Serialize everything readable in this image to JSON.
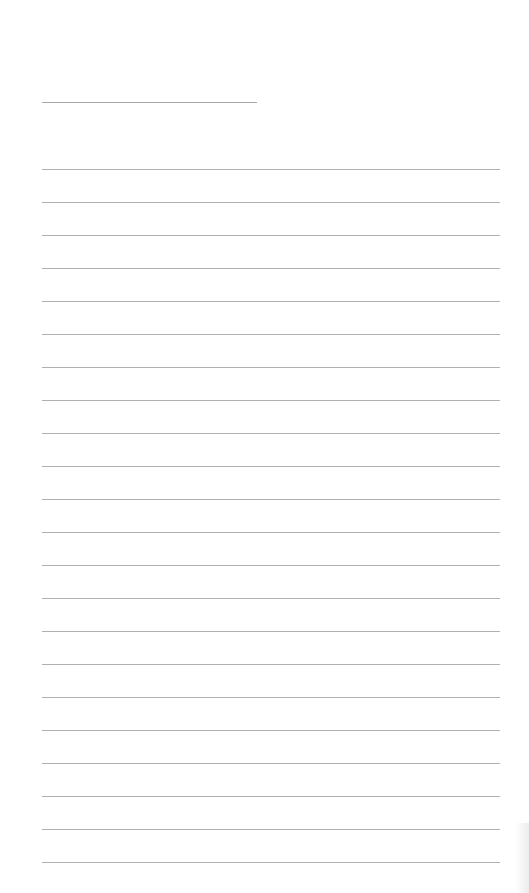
{
  "page": {
    "type": "lined-paper",
    "background_color": "#ffffff",
    "line_color": "#b0b0b0",
    "title_line": {
      "left": 42,
      "top": 102,
      "width": 215
    },
    "ruled_lines": {
      "count": 22,
      "first_top": 169,
      "spacing": 33.0,
      "left": 42,
      "width": 458
    }
  }
}
